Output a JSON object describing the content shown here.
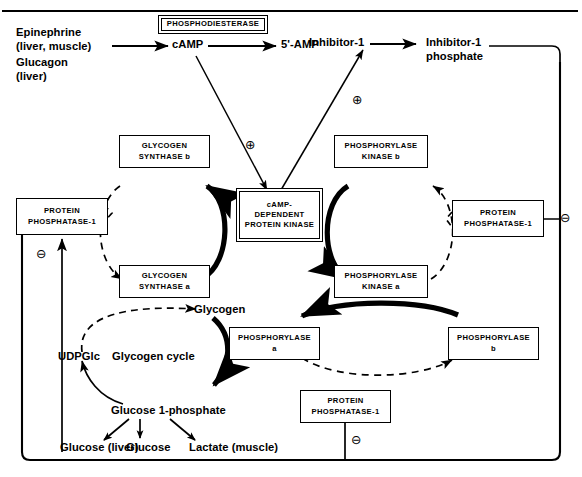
{
  "figure": {
    "frame_color": "#000000",
    "background": "#ffffff"
  },
  "hormones": {
    "line1": "Epinephrine",
    "line2": "(liver, muscle)",
    "line3": "Glucagon",
    "line4": "(liver)"
  },
  "nucleotides": {
    "camp": "cAMP",
    "amp": "5'-AMP"
  },
  "inhibitor": {
    "free": "Inhibitor-1",
    "phospho_line1": "Inhibitor-1",
    "phospho_line2": "phosphate"
  },
  "enzymes": {
    "phosphodiesterase": "PHOSPHODIESTERASE",
    "pka_line1": "cAMP-",
    "pka_line2": "DEPENDENT",
    "pka_line3": "PROTEIN KINASE",
    "glycogen_synthase_b_line1": "GLYCOGEN",
    "glycogen_synthase_b_line2": "SYNTHASE  b",
    "glycogen_synthase_a_line1": "GLYCOGEN",
    "glycogen_synthase_a_line2": "SYNTHASE  a",
    "phosphorylase_kinase_b_line1": "PHOSPHORYLASE",
    "phosphorylase_kinase_b_line2": "KINASE  b",
    "phosphorylase_kinase_a_line1": "PHOSPHORYLASE",
    "phosphorylase_kinase_a_line2": "KINASE  a",
    "phosphorylase_a_line1": "PHOSPHORYLASE",
    "phosphorylase_a_line2": "a",
    "phosphorylase_b_line1": "PHOSPHORYLASE",
    "phosphorylase_b_line2": "b",
    "protein_phosphatase_line1": "PROTEIN",
    "protein_phosphatase_line2": "PHOSPHATASE-1"
  },
  "metabolites": {
    "glycogen": "Glycogen",
    "udpglc": "UDPGlc",
    "cycle_label": "Glycogen cycle",
    "glucose_1_phosphate": "Glucose 1-phosphate",
    "glucose_liver": "Glucose (liver)",
    "glucose": "Glucose",
    "lactate_muscle": "Lactate (muscle)"
  },
  "signs": {
    "activation": "⊕",
    "inhibition": "⊖",
    "activation_name": "plus-circle-icon",
    "inhibition_name": "minus-circle-icon"
  }
}
